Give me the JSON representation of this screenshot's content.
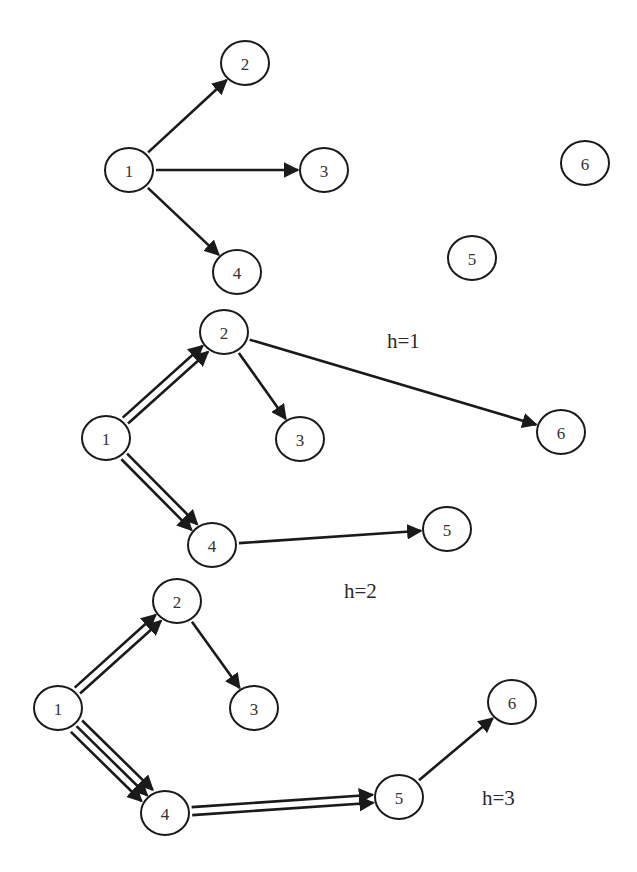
{
  "colors": {
    "stroke": "#1a1a1a",
    "background": "#ffffff",
    "text": "#333333"
  },
  "graphs": [
    {
      "id": "h0",
      "label": null,
      "nodes": [
        {
          "id": "1",
          "label": "1",
          "x": 129,
          "y": 170
        },
        {
          "id": "2",
          "label": "2",
          "x": 245,
          "y": 63
        },
        {
          "id": "3",
          "label": "3",
          "x": 324,
          "y": 170
        },
        {
          "id": "4",
          "label": "4",
          "x": 237,
          "y": 272
        },
        {
          "id": "5",
          "label": "5",
          "x": 472,
          "y": 258
        },
        {
          "id": "6",
          "label": "6",
          "x": 585,
          "y": 163
        }
      ],
      "edges": [
        {
          "from": "1",
          "to": "2",
          "count": 1
        },
        {
          "from": "1",
          "to": "3",
          "count": 1
        },
        {
          "from": "1",
          "to": "4",
          "count": 1
        }
      ]
    },
    {
      "id": "h1",
      "label": {
        "text": "h=1",
        "x": 387,
        "y": 348
      },
      "nodes": [
        {
          "id": "1",
          "label": "1",
          "x": 106,
          "y": 438
        },
        {
          "id": "2",
          "label": "2",
          "x": 224,
          "y": 332
        },
        {
          "id": "3",
          "label": "3",
          "x": 300,
          "y": 439
        },
        {
          "id": "4",
          "label": "4",
          "x": 212,
          "y": 545
        },
        {
          "id": "5",
          "label": "5",
          "x": 447,
          "y": 529
        },
        {
          "id": "6",
          "label": "6",
          "x": 561,
          "y": 432
        }
      ],
      "edges": [
        {
          "from": "1",
          "to": "2",
          "count": 2
        },
        {
          "from": "1",
          "to": "4",
          "count": 2
        },
        {
          "from": "2",
          "to": "3",
          "count": 1
        },
        {
          "from": "2",
          "to": "6",
          "count": 1
        },
        {
          "from": "4",
          "to": "5",
          "count": 1
        }
      ]
    },
    {
      "id": "h2",
      "label": {
        "text": "h=2",
        "x": 344,
        "y": 598
      },
      "nodes": [
        {
          "id": "1",
          "label": "1",
          "x": 58,
          "y": 708
        },
        {
          "id": "2",
          "label": "2",
          "x": 177,
          "y": 601
        },
        {
          "id": "3",
          "label": "3",
          "x": 254,
          "y": 708
        },
        {
          "id": "4",
          "label": "4",
          "x": 165,
          "y": 813
        },
        {
          "id": "5",
          "label": "5",
          "x": 399,
          "y": 797
        },
        {
          "id": "6",
          "label": "6",
          "x": 512,
          "y": 702
        }
      ],
      "edges": [
        {
          "from": "1",
          "to": "2",
          "count": 2
        },
        {
          "from": "1",
          "to": "4",
          "count": 3
        },
        {
          "from": "2",
          "to": "3",
          "count": 1
        },
        {
          "from": "4",
          "to": "5",
          "count": 2
        },
        {
          "from": "5",
          "to": "6",
          "count": 1
        }
      ]
    }
  ],
  "extra_labels": [
    {
      "text": "h=3",
      "x": 482,
      "y": 805
    }
  ],
  "node_radius": {
    "rx": 24,
    "ry": 22
  }
}
